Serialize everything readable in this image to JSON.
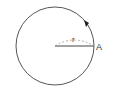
{
  "diagram": {
    "type": "circle-radius",
    "circle": {
      "cx": 55,
      "cy": 46,
      "r": 39,
      "stroke": "#555555"
    },
    "radius_label": "r",
    "point_label": "A",
    "direction": "counterclockwise",
    "colors": {
      "line": "#444444",
      "dashed": "#999999",
      "text": "#333333"
    }
  }
}
